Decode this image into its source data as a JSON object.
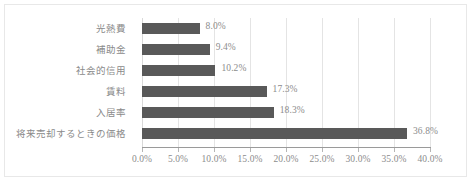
{
  "chart_data": {
    "type": "bar",
    "orientation": "horizontal",
    "title": "",
    "xlabel": "",
    "ylabel": "",
    "categories": [
      "光熱費",
      "補助金",
      "社会的信用",
      "賃料",
      "入居率",
      "将来売却するときの価格"
    ],
    "values": [
      8.0,
      9.4,
      10.2,
      17.3,
      18.3,
      36.8
    ],
    "data_labels": [
      "8.0%",
      "9.4%",
      "10.2%",
      "17.3%",
      "18.3%",
      "36.8%"
    ],
    "xlim": [
      0,
      40
    ],
    "xtick_values": [
      0,
      5,
      10,
      15,
      20,
      25,
      30,
      35,
      40
    ],
    "xtick_labels": [
      "0.0%",
      "5.0%",
      "10.0%",
      "15.0%",
      "20.0%",
      "25.0%",
      "30.0%",
      "35.0%",
      "40.0%"
    ],
    "grid": true,
    "legend": false,
    "bar_color": "#595959",
    "gridline_color": "#e4e4e4",
    "axis_color": "#9a9a9a",
    "label_color": "#8c8c8c",
    "frame_border_color": "#e8e8e8",
    "background_color": "#ffffff"
  }
}
